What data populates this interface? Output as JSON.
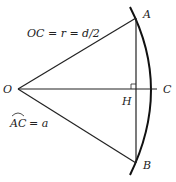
{
  "diagram": {
    "points": {
      "O": {
        "label": "O",
        "x": 18,
        "y": 89
      },
      "A": {
        "label": "A",
        "x": 136,
        "y": 18
      },
      "B": {
        "label": "B",
        "x": 136,
        "y": 163
      },
      "H": {
        "label": "H",
        "x": 136,
        "y": 89
      },
      "C": {
        "label": "C",
        "x": 157,
        "y": 89
      }
    },
    "annotations": {
      "radius": "OC = r = d/2",
      "arc_label_base": "AC",
      "arc_label_rest": "= a"
    },
    "segments": [
      {
        "from": "O",
        "to": "A"
      },
      {
        "from": "O",
        "to": "B"
      },
      {
        "from": "O",
        "to": "C"
      },
      {
        "from": "A",
        "to": "B"
      }
    ],
    "arc": {
      "from_label": "top",
      "through": "C",
      "to_label": "bottom"
    },
    "right_angle_at": "H",
    "colors": {
      "stroke": "#222222",
      "background": "#ffffff"
    }
  }
}
